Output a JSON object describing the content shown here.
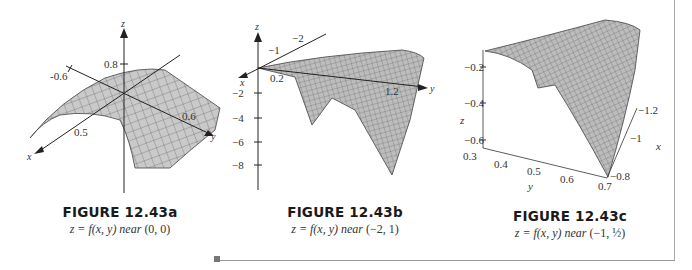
{
  "figures": [
    {
      "id": "a",
      "title": "FIGURE 12.43a",
      "subtitle_prefix": "z = f(x, y) near",
      "subtitle_point": "(0, 0)",
      "axes": {
        "x_label": "x",
        "y_label": "y",
        "z_label": "z"
      },
      "ticks": {
        "x": [
          "0.5"
        ],
        "y": [
          "-0.6",
          "0.6"
        ],
        "z": [
          "0.8"
        ]
      }
    },
    {
      "id": "b",
      "title": "FIGURE 12.43b",
      "subtitle_prefix": "z = f(x, y) near",
      "subtitle_point": "(−2, 1)",
      "axes": {
        "x_label": "x",
        "y_label": "y",
        "z_label": "z"
      },
      "ticks": {
        "x": [
          "−1",
          "−2"
        ],
        "y": [
          "0.2",
          "1.2"
        ],
        "z": [
          "−2",
          "−4",
          "−6",
          "−8"
        ]
      }
    },
    {
      "id": "c",
      "title": "FIGURE 12.43c",
      "subtitle_prefix": "z = f(x, y) near",
      "subtitle_point": "(−1, ½)",
      "axes": {
        "x_label": "x",
        "y_label": "y",
        "z_label": "z"
      },
      "ticks": {
        "x": [
          "−1.2",
          "−1",
          "−0.8"
        ],
        "y": [
          "0.3",
          "0.4",
          "0.5",
          "0.6",
          "0.7"
        ],
        "z": [
          "−0.2",
          "−0.4",
          "−0.6"
        ]
      }
    }
  ]
}
